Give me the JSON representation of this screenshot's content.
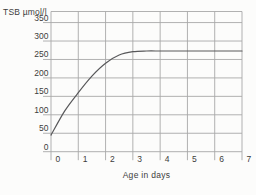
{
  "chart": {
    "y_axis_title": "TSB µmol/l",
    "x_axis_title": "Age in days",
    "colors": {
      "grid": "#a8a8a8",
      "curve": "#58585a",
      "text": "#3c3c3c",
      "background": "#fcfcfb"
    }
  },
  "chart_data": {
    "type": "line",
    "title": "",
    "xlabel": "Age in days",
    "ylabel": "TSB µmol/l",
    "x": [
      0,
      0.5,
      1,
      1.5,
      2,
      2.5,
      3,
      3.5,
      4,
      4.5,
      5,
      5.5,
      6,
      6.5,
      7
    ],
    "values": [
      45,
      110,
      160,
      205,
      240,
      262,
      271,
      273,
      273,
      273,
      273,
      273,
      273,
      273,
      273
    ],
    "x_ticks": [
      0,
      1,
      2,
      3,
      4,
      5,
      6,
      7
    ],
    "y_ticks": [
      0,
      50,
      100,
      150,
      200,
      250,
      300,
      350
    ],
    "xlim": [
      0,
      7
    ],
    "ylim": [
      0,
      380
    ],
    "grid": true,
    "legend": false
  }
}
